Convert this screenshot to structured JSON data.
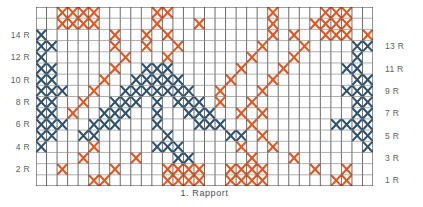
{
  "chart_data": {
    "type": "heatmap",
    "title": "",
    "xlabel": "1. Rapport",
    "ylabel": "",
    "grid": true,
    "legend_position": "none",
    "columns": 32,
    "rows": 16,
    "symbol": "cross",
    "colors": {
      "blue": "#2f536f",
      "orange": "#e8551c",
      "grid_line": "#3a3a3a",
      "grid_minor": "#8a8a8a",
      "background": "#ffffff",
      "label_text": "#5d5f62"
    },
    "categories": [
      "1",
      "2",
      "3",
      "4",
      "5",
      "6",
      "7",
      "8",
      "9",
      "10",
      "11",
      "12",
      "13",
      "14",
      "15",
      "16",
      "17",
      "18",
      "19",
      "20",
      "21",
      "22",
      "23",
      "24",
      "25",
      "26",
      "27",
      "28",
      "29",
      "30",
      "31",
      "32"
    ],
    "row_names": [
      "16",
      "15",
      "14",
      "13",
      "12",
      "11",
      "10",
      "9",
      "8",
      "7",
      "6",
      "5",
      "4",
      "3",
      "2",
      "1"
    ],
    "cells": [
      "..OOOO.....OO.........O....OOO..",
      "..OOOO.....O...O......O...OOOO..",
      "B......O..O.O.........O.O..OOO.O",
      "BB.....O..O..O.......O...O....BB",
      "B.......O...O.......O...O.....B.",
      "BB.....O..BBB......O...O.....BB.",
      "BB....O..BBBBB....O...O.......BB",
      "BBB..O..BBBBBBB..O...O.......BBB",
      "BB..O..BBB.B.BBB.O..O.........BB",
      "BB.O..BBB..B..BBB..O.O........BB",
      "BBB..BBB...B...BBB..O.......BBBB",
      "BB..BB......B.....BB.O........BB",
      "B....O.....BBB.....O..O........B",
      "....O....O...BB.....O...O.......",
      "..O....O....OOOO..OOOO....O..O..",
      ".....OO.....OOOO..OOOO......OO.."
    ],
    "cells_legend": {
      "B": "blue-cross",
      "O": "orange-cross",
      ".": "empty"
    }
  },
  "row_labels_left": [
    {
      "text": "14 R",
      "row": 2
    },
    {
      "text": "12 R",
      "row": 4
    },
    {
      "text": "10 R",
      "row": 6
    },
    {
      "text": "8 R",
      "row": 8
    },
    {
      "text": "6 R",
      "row": 10
    },
    {
      "text": "4 R",
      "row": 12
    },
    {
      "text": "2 R",
      "row": 14
    }
  ],
  "row_labels_right": [
    {
      "text": "13 R",
      "row": 3
    },
    {
      "text": "11 R",
      "row": 5
    },
    {
      "text": "9 R",
      "row": 7
    },
    {
      "text": "7 R",
      "row": 9
    },
    {
      "text": "5 R",
      "row": 11
    },
    {
      "text": "3 R",
      "row": 13
    },
    {
      "text": "1 R",
      "row": 15
    }
  ],
  "footer": {
    "rapport_label": "1. Rapport"
  }
}
